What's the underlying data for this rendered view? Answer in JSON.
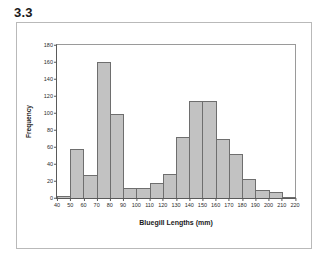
{
  "figure": {
    "label": "3.3"
  },
  "chart_data": {
    "type": "bar",
    "title": "",
    "subtitle": "",
    "xlabel": "Bluegill Lengths (mm)",
    "ylabel": "Frequency",
    "xlim": [
      40,
      220
    ],
    "ylim": [
      0,
      180
    ],
    "bin_width": 10,
    "grid": false,
    "legend": null,
    "xticks": [
      40,
      50,
      60,
      70,
      80,
      90,
      100,
      110,
      120,
      130,
      140,
      150,
      160,
      170,
      180,
      190,
      200,
      210,
      220
    ],
    "yticks": [
      0,
      20,
      40,
      60,
      80,
      100,
      120,
      140,
      160,
      180
    ],
    "bin_edges": [
      40,
      50,
      60,
      70,
      80,
      90,
      100,
      110,
      120,
      130,
      140,
      150,
      160,
      170,
      180,
      190,
      200,
      210,
      220
    ],
    "categories": [
      "40-50",
      "50-60",
      "60-70",
      "70-80",
      "80-90",
      "90-100",
      "100-110",
      "110-120",
      "120-130",
      "130-140",
      "140-150",
      "150-160",
      "160-170",
      "170-180",
      "180-190",
      "190-200",
      "200-210",
      "210-220"
    ],
    "values": [
      2,
      58,
      27,
      160,
      99,
      12,
      12,
      18,
      28,
      72,
      114,
      114,
      70,
      52,
      22,
      10,
      7,
      1
    ],
    "bar_fill_color": "#c2c2c2",
    "bar_border_color": "#6e6e6e"
  }
}
